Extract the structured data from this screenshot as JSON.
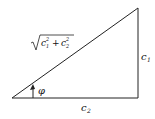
{
  "diagram": {
    "type": "right-triangle",
    "labels": {
      "hypotenuse_base": "c",
      "hypotenuse_sub1": "1",
      "hypotenuse_sub2": "2",
      "hypotenuse_sup": "2",
      "hypotenuse_plus": "+",
      "vertical_side_base": "c",
      "vertical_side_sub": "1",
      "horizontal_side_base": "c",
      "horizontal_side_sub": "2",
      "angle": "φ"
    },
    "colors": {
      "stroke": "#222222",
      "background": "#ffffff"
    }
  }
}
